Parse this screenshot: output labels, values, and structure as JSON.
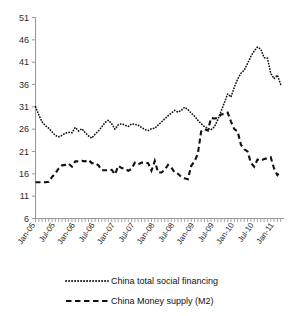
{
  "chart_data": {
    "type": "line",
    "title": "",
    "xlabel": "",
    "ylabel": "",
    "ylim": [
      6,
      51
    ],
    "ytick_labels": [
      "6",
      "11",
      "16",
      "21",
      "26",
      "31",
      "36",
      "41",
      "46",
      "51"
    ],
    "ytick_values": [
      6,
      11,
      16,
      21,
      26,
      31,
      36,
      41,
      46,
      51
    ],
    "grid": false,
    "legend_position": "bottom",
    "x": [
      "Jan-05",
      "Feb-05",
      "Mar-05",
      "Apr-05",
      "May-05",
      "Jun-05",
      "Jul-05",
      "Aug-05",
      "Sep-05",
      "Oct-05",
      "Nov-05",
      "Dec-05",
      "Jan-06",
      "Feb-06",
      "Mar-06",
      "Apr-06",
      "May-06",
      "Jun-06",
      "Jul-06",
      "Aug-06",
      "Sep-06",
      "Oct-06",
      "Nov-06",
      "Dec-06",
      "Jan-07",
      "Feb-07",
      "Mar-07",
      "Apr-07",
      "May-07",
      "Jun-07",
      "Jul-07",
      "Aug-07",
      "Sep-07",
      "Oct-07",
      "Nov-07",
      "Dec-07",
      "Jan-08",
      "Feb-08",
      "Mar-08",
      "Apr-08",
      "May-08",
      "Jun-08",
      "Jul-08",
      "Aug-08",
      "Sep-08",
      "Oct-08",
      "Nov-08",
      "Dec-08",
      "Jan-09",
      "Feb-09",
      "Mar-09",
      "Apr-09",
      "May-09",
      "Jun-09",
      "Jul-09",
      "Aug-09",
      "Sep-09",
      "Oct-09",
      "Nov-09",
      "Dec-09",
      "Jan-10",
      "Feb-10",
      "Mar-10",
      "Apr-10",
      "May-10",
      "Jun-10",
      "Jul-10",
      "Aug-10",
      "Sep-10",
      "Oct-10",
      "Nov-10",
      "Dec-10",
      "Jan-11",
      "Feb-11",
      "Mar-11"
    ],
    "xtick_labels": [
      "Jan-05",
      "Jul-05",
      "Jan-06",
      "Jul-06",
      "Jan-07",
      "Jul-07",
      "Jan-08",
      "Jul-08",
      "Jan-09",
      "Jul-09",
      "Jan-10",
      "Jul-10",
      "Jan-11"
    ],
    "series": [
      {
        "name": "China total social financing",
        "style": "dotted",
        "color": "#111111",
        "values": [
          31.0,
          29.2,
          27.6,
          26.8,
          26.2,
          25.4,
          24.6,
          24.3,
          24.6,
          25.1,
          25.3,
          25.2,
          26.4,
          25.6,
          26.1,
          25.2,
          24.5,
          24.0,
          24.9,
          25.6,
          26.5,
          27.5,
          28.0,
          27.2,
          26.0,
          27.0,
          27.2,
          26.9,
          26.6,
          27.2,
          27.1,
          26.9,
          26.4,
          25.9,
          25.7,
          26.1,
          26.2,
          26.9,
          27.6,
          28.3,
          29.0,
          29.6,
          30.2,
          29.8,
          30.2,
          30.9,
          30.4,
          29.6,
          28.9,
          28.0,
          27.2,
          26.6,
          26.2,
          25.9,
          26.5,
          28.1,
          30.0,
          31.9,
          33.9,
          33.2,
          35.4,
          37.2,
          38.5,
          39.2,
          40.7,
          42.3,
          43.5,
          44.4,
          43.9,
          42.0,
          41.9,
          38.5,
          37.3,
          38.1,
          36.0
        ]
      },
      {
        "name": "China Money supply (M2)",
        "style": "dashed",
        "color": "#111111",
        "values": [
          14.1,
          14.1,
          14.1,
          14.1,
          14.2,
          15.3,
          16.1,
          17.2,
          17.9,
          18.0,
          18.3,
          17.6,
          18.8,
          18.8,
          18.9,
          18.8,
          19.1,
          18.4,
          18.4,
          17.9,
          16.8,
          16.8,
          16.8,
          16.9,
          15.9,
          17.8,
          17.3,
          17.1,
          16.7,
          17.1,
          18.5,
          18.1,
          18.5,
          18.5,
          18.4,
          16.7,
          18.9,
          16.3,
          16.3,
          16.9,
          18.0,
          17.4,
          16.3,
          16.0,
          15.3,
          15.0,
          14.8,
          17.8,
          18.8,
          20.5,
          25.5,
          26.0,
          25.7,
          28.5,
          28.4,
          28.5,
          29.3,
          29.4,
          29.7,
          27.7,
          26.0,
          25.5,
          22.5,
          21.5,
          21.0,
          18.5,
          17.6,
          19.2,
          19.0,
          19.3,
          19.5,
          19.7,
          17.2,
          15.7,
          16.6
        ]
      }
    ]
  },
  "legend": {
    "items": [
      {
        "label": "China total social financing",
        "marker": "dotted-line-marker"
      },
      {
        "label": "China Money supply (M2)",
        "marker": "dashed-line-marker"
      }
    ]
  }
}
